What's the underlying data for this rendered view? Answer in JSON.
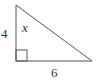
{
  "diagram": {
    "type": "right-triangle",
    "vertices": {
      "top": [
        16,
        5
      ],
      "bottom_left": [
        16,
        61
      ],
      "bottom_right": [
        92,
        61
      ]
    },
    "right_angle_at": "bottom_left",
    "labels": {
      "vertical_leg": "4",
      "horizontal_leg": "6",
      "angle": "x"
    },
    "colors": {
      "stroke": "#555555",
      "text": "#333333",
      "background": "#ffffff"
    }
  }
}
